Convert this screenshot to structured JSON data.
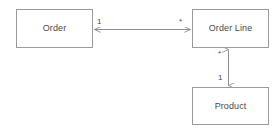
{
  "diagram": {
    "type": "uml-class-diagram",
    "colors": {
      "box_border": "#9a9a9a",
      "box_fill": "#ffffff",
      "edge_stroke": "#8f8f8f",
      "text": "#4a4a4a",
      "background": "#ffffff"
    },
    "classes": [
      {
        "id": "order",
        "name": "Order",
        "x": 16,
        "y": 9,
        "width": 77,
        "height": 39
      },
      {
        "id": "order_line",
        "name": "Order Line",
        "x": 192,
        "y": 9,
        "width": 77,
        "height": 39
      },
      {
        "id": "product",
        "name": "Product",
        "x": 192,
        "y": 87,
        "width": 77,
        "height": 38
      }
    ],
    "associations": [
      {
        "id": "order-to-order-line",
        "from": "order",
        "to": "order_line",
        "orientation": "horizontal",
        "arrowheads": "both",
        "source_multiplicity": "1",
        "target_multiplicity": "*"
      },
      {
        "id": "order-line-to-product",
        "from": "order_line",
        "to": "product",
        "orientation": "vertical",
        "arrowheads": "both",
        "source_multiplicity": "*",
        "target_multiplicity": "1"
      }
    ]
  }
}
